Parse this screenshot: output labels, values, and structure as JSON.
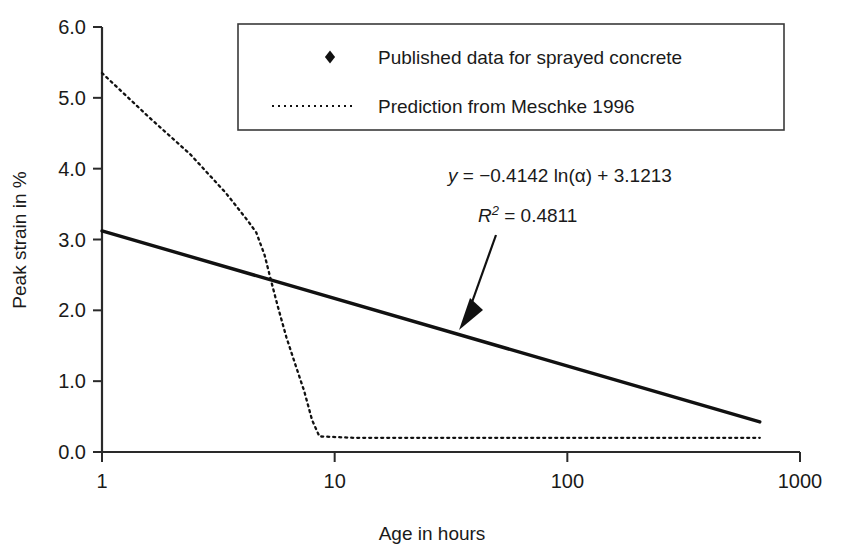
{
  "chart_data": {
    "type": "scatter",
    "title": "",
    "xlabel": "Age in hours",
    "ylabel": "Peak strain in %",
    "xscale": "log",
    "xlim": [
      1,
      1000
    ],
    "ylim": [
      0.0,
      6.0
    ],
    "xticks": [
      1,
      10,
      100,
      1000
    ],
    "xtick_labels": [
      "1",
      "10",
      "100",
      "1000"
    ],
    "yticks": [
      0.0,
      1.0,
      2.0,
      3.0,
      4.0,
      5.0,
      6.0
    ],
    "ytick_labels": [
      "0.0",
      "1.0",
      "2.0",
      "3.0",
      "4.0",
      "5.0",
      "6.0"
    ],
    "grid": false,
    "legend_position": "top-center",
    "series": [
      {
        "name": "Published data for sprayed concrete",
        "type": "scatter",
        "marker": "diamond",
        "color": "#111111",
        "points": [
          [
            1,
            5.0
          ],
          [
            3,
            2.52
          ],
          [
            3,
            2.28
          ],
          [
            4.8,
            2.6
          ],
          [
            6,
            2.9
          ],
          [
            6,
            1.18
          ],
          [
            8.5,
            2.75
          ],
          [
            12,
            4.02
          ],
          [
            12,
            3.5
          ],
          [
            12,
            2.52
          ],
          [
            12,
            1.92
          ],
          [
            20,
            1.17
          ],
          [
            20,
            0.69
          ],
          [
            25,
            2.55
          ],
          [
            25,
            2.22
          ],
          [
            25,
            2.0
          ],
          [
            25,
            1.3
          ],
          [
            25,
            0.8
          ],
          [
            25,
            0.3
          ],
          [
            25,
            0.25
          ],
          [
            70,
            2.2
          ],
          [
            70,
            1.5
          ],
          [
            70,
            1.42
          ],
          [
            70,
            0.42
          ],
          [
            90,
            1.12
          ],
          [
            90,
            0.9
          ],
          [
            170,
            1.98
          ],
          [
            170,
            1.27
          ],
          [
            170,
            1.18
          ],
          [
            170,
            0.83
          ],
          [
            170,
            0.72
          ],
          [
            170,
            0.62
          ],
          [
            330,
            0.55
          ],
          [
            672,
            1.23
          ],
          [
            672,
            1.05
          ],
          [
            672,
            0.85
          ],
          [
            672,
            0.78
          ],
          [
            672,
            0.55
          ],
          [
            672,
            0.47
          ],
          [
            672,
            0.2
          ]
        ]
      },
      {
        "name": "Prediction from Meschke 1996",
        "type": "line",
        "style": "dotted",
        "color": "#111111",
        "points": [
          [
            1,
            5.35
          ],
          [
            1.6,
            4.72
          ],
          [
            2.4,
            4.2
          ],
          [
            3.4,
            3.66
          ],
          [
            4.2,
            3.28
          ],
          [
            4.6,
            3.1
          ],
          [
            5.0,
            2.78
          ],
          [
            5.3,
            2.45
          ],
          [
            5.7,
            2.05
          ],
          [
            6.2,
            1.62
          ],
          [
            6.8,
            1.22
          ],
          [
            7.4,
            0.86
          ],
          [
            8.0,
            0.45
          ],
          [
            8.6,
            0.22
          ],
          [
            12,
            0.2
          ],
          [
            30,
            0.2
          ],
          [
            100,
            0.2
          ],
          [
            300,
            0.2
          ],
          [
            672,
            0.2
          ]
        ]
      },
      {
        "name": "Logarithmic trendline",
        "type": "line",
        "style": "solid",
        "color": "#111111",
        "points": [
          [
            1,
            3.1213
          ],
          [
            672,
            0.42
          ]
        ]
      }
    ],
    "annotations": {
      "equation": "y = −0.4142 ln(α) + 3.1213",
      "equation_parts": {
        "y": "y",
        "body": " = −0.4142 ln(α) + 3.1213"
      },
      "r_squared": "R",
      "r_squared_sup": "2",
      "r_squared_value": " = 0.4811",
      "fit_slope": -0.4142,
      "fit_intercept": 3.1213,
      "r2": 0.4811,
      "arrow": "points from annotation down-left to the trendline"
    }
  },
  "legend": {
    "items": [
      {
        "label": "Published data for sprayed concrete",
        "marker": "diamond-marker"
      },
      {
        "label": "Prediction from Meschke 1996",
        "marker": "dotted-line-marker"
      }
    ]
  },
  "axes": {
    "x_title": "Age in hours",
    "y_title": "Peak strain in %"
  },
  "colors": {
    "ink": "#111111",
    "axis": "#2a2a2a",
    "background": "#ffffff"
  }
}
